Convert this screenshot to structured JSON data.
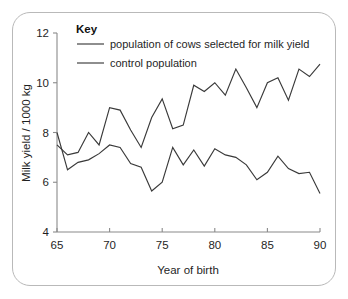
{
  "figure": {
    "frame_border_color": "#b9b9b9",
    "background_color": "#ffffff",
    "line_color": "#3a3a3a",
    "axis_color": "#8a8a8a"
  },
  "legend": {
    "title": "Key",
    "items": [
      {
        "label": "population of cows selected for milk yield"
      },
      {
        "label": "control population"
      }
    ]
  },
  "axes": {
    "x_title": "Year of birth",
    "y_title": "Milk yield / 1000 kg",
    "x_ticks": [
      "65",
      "70",
      "75",
      "80",
      "85",
      "90"
    ],
    "y_ticks": [
      "4",
      "6",
      "8",
      "10",
      "12"
    ]
  },
  "chart_data": {
    "type": "line",
    "title": "",
    "xlabel": "Year of birth",
    "ylabel": "Milk yield / 1000 kg",
    "xlim": [
      65,
      90
    ],
    "ylim": [
      4,
      12
    ],
    "x_ticks": [
      65,
      70,
      75,
      80,
      85,
      90
    ],
    "y_ticks": [
      4,
      6,
      8,
      10,
      12
    ],
    "grid": false,
    "legend_title": "Key",
    "legend_position": "top-inside",
    "x": [
      65,
      66,
      67,
      68,
      69,
      70,
      71,
      72,
      73,
      74,
      75,
      76,
      77,
      78,
      79,
      80,
      81,
      82,
      83,
      84,
      85,
      86,
      87,
      88,
      89,
      90
    ],
    "series": [
      {
        "name": "population of cows selected for milk yield",
        "values": [
          7.5,
          7.1,
          7.2,
          8.0,
          7.5,
          9.0,
          8.9,
          8.1,
          7.4,
          8.6,
          9.35,
          8.15,
          8.3,
          9.9,
          9.65,
          10.0,
          9.5,
          10.55,
          9.8,
          9.0,
          10.0,
          10.2,
          9.3,
          10.55,
          10.25,
          10.75
        ]
      },
      {
        "name": "control population",
        "values": [
          8.0,
          6.5,
          6.8,
          6.9,
          7.15,
          7.5,
          7.4,
          6.75,
          6.6,
          5.65,
          6.0,
          7.4,
          6.7,
          7.3,
          6.65,
          7.35,
          7.1,
          7.0,
          6.7,
          6.1,
          6.4,
          7.05,
          6.55,
          6.35,
          6.4,
          5.55
        ]
      }
    ]
  }
}
